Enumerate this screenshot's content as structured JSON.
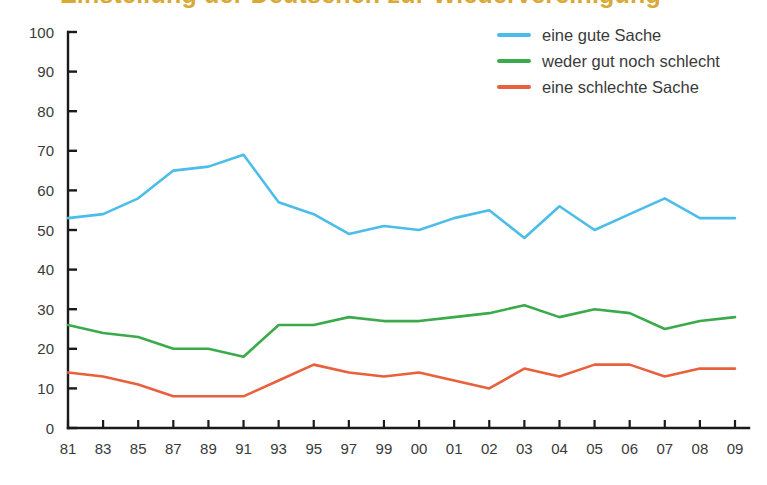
{
  "title": {
    "text": "Einstellung der Deutschen zur Wiedervereinigung",
    "color": "#D9A936"
  },
  "legend": {
    "position": "top-right",
    "items": [
      {
        "label": "eine gute Sache",
        "color": "#4BBDE8",
        "swatch_name": "legend-swatch-blue"
      },
      {
        "label": "weder gut noch schlecht",
        "color": "#3AAA4A",
        "swatch_name": "legend-swatch-green"
      },
      {
        "label": "eine schlechte Sache",
        "color": "#E8603C",
        "swatch_name": "legend-swatch-orange"
      }
    ]
  },
  "chart_data": {
    "type": "line",
    "title": "",
    "xlabel": "",
    "ylabel": "",
    "ylim": [
      0,
      100
    ],
    "yticks": [
      0,
      10,
      20,
      30,
      40,
      50,
      60,
      70,
      80,
      90,
      100
    ],
    "grid": false,
    "legend_position": "top-right",
    "categories": [
      "81",
      "83",
      "85",
      "87",
      "89",
      "91",
      "93",
      "95",
      "97",
      "99",
      "00",
      "01",
      "02",
      "03",
      "04",
      "05",
      "06",
      "07",
      "08",
      "09"
    ],
    "series": [
      {
        "name": "eine gute Sache",
        "color": "#4BBDE8",
        "values": [
          53,
          54,
          58,
          65,
          66,
          69,
          57,
          54,
          49,
          51,
          50,
          53,
          55,
          48,
          56,
          50,
          54,
          58,
          53,
          53
        ]
      },
      {
        "name": "weder gut noch schlecht",
        "color": "#3AAA4A",
        "values": [
          26,
          24,
          23,
          20,
          20,
          18,
          26,
          26,
          28,
          27,
          27,
          28,
          29,
          31,
          28,
          30,
          29,
          25,
          27,
          28
        ]
      },
      {
        "name": "eine schlechte Sache",
        "color": "#E8603C",
        "values": [
          14,
          13,
          11,
          8,
          8,
          8,
          12,
          16,
          14,
          13,
          14,
          12,
          10,
          15,
          13,
          16,
          16,
          13,
          15,
          15
        ]
      }
    ]
  },
  "axis": {
    "color": "#1a1a1a",
    "xtick_labels": [
      "81",
      "83",
      "85",
      "87",
      "89",
      "91",
      "93",
      "95",
      "97",
      "99",
      "00",
      "01",
      "02",
      "03",
      "04",
      "05",
      "06",
      "07",
      "08",
      "09"
    ],
    "ytick_labels": [
      "0",
      "10",
      "20",
      "30",
      "40",
      "50",
      "60",
      "70",
      "80",
      "90",
      "100"
    ]
  }
}
